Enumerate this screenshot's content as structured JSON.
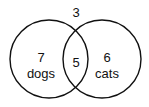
{
  "diagram": {
    "type": "venn",
    "outside": {
      "value": "3"
    },
    "left_set": {
      "value": "7",
      "label": "dogs"
    },
    "intersection": {
      "value": "5"
    },
    "right_set": {
      "value": "6",
      "label": "cats"
    },
    "colors": {
      "stroke": "#111111",
      "background": "#ffffff"
    }
  }
}
